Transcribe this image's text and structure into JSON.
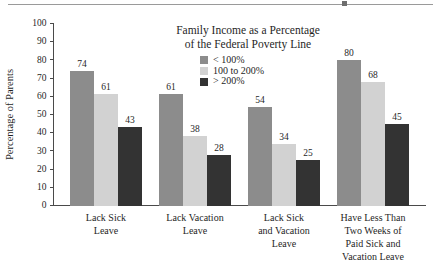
{
  "figure": {
    "separator_rule": true
  },
  "chart_data": {
    "type": "bar",
    "title": "",
    "xlabel": "",
    "ylabel": "Percentage of Parents",
    "ylim": [
      0,
      100
    ],
    "yticks": [
      0,
      10,
      20,
      30,
      40,
      50,
      60,
      70,
      80,
      90,
      100
    ],
    "grid": false,
    "legend_position": "inside-top-center",
    "legend_title": [
      "Family Income as a Percentage",
      "of the Federal Poverty Line"
    ],
    "categories": [
      "Lack Sick Leave",
      "Lack Vacation Leave",
      "Lack Sick and Vacation Leave",
      "Have Less Than Two Weeks of Paid Sick and Vacation Leave"
    ],
    "category_lines": [
      [
        "Lack Sick",
        "Leave"
      ],
      [
        "Lack Vacation",
        "Leave"
      ],
      [
        "Lack Sick",
        "and Vacation",
        "Leave"
      ],
      [
        "Have Less Than",
        "Two Weeks of",
        "Paid Sick and",
        "Vacation Leave"
      ]
    ],
    "series": [
      {
        "name": "< 100%",
        "color": "#8c8c8c",
        "values": [
          74,
          61,
          54,
          80
        ]
      },
      {
        "name": "100 to 200%",
        "color": "#d2d2d2",
        "values": [
          61,
          38,
          34,
          68
        ]
      },
      {
        "name": "> 200%",
        "color": "#333333",
        "values": [
          43,
          28,
          25,
          45
        ]
      }
    ],
    "series_values_display": {
      "group_1": [
        "74",
        "61",
        "43"
      ],
      "group_2": [
        "57",
        "38",
        "28"
      ],
      "group_3": [
        "54",
        "34",
        "25"
      ],
      "group_4": [
        "80",
        "68",
        "45"
      ]
    },
    "bars": [
      {
        "group": "Lack Sick Leave",
        "series": "< 100%",
        "value": 74,
        "label": "74"
      },
      {
        "group": "Lack Sick Leave",
        "series": "100 to 200%",
        "value": 61,
        "label": "61"
      },
      {
        "group": "Lack Sick Leave",
        "series": "> 200%",
        "value": 43,
        "label": "43"
      },
      {
        "group": "Lack Vacation Leave",
        "series": "< 100%",
        "value": 57,
        "label": "57"
      },
      {
        "group": "Lack Vacation Leave",
        "series": "100 to 200%",
        "value": 38,
        "label": "38"
      },
      {
        "group": "Lack Vacation Leave",
        "series": "> 200%",
        "value": 28,
        "label": "28"
      },
      {
        "group": "Lack Sick and Vacation Leave",
        "series": "< 100%",
        "value": 54,
        "label": "54"
      },
      {
        "group": "Lack Sick and Vacation Leave",
        "series": "100 to 200%",
        "value": 34,
        "label": "34"
      },
      {
        "group": "Lack Sick and Vacation Leave",
        "series": "> 200%",
        "value": 25,
        "label": "25"
      },
      {
        "group": "Have Less Than Two Weeks of Paid Sick and Vacation Leave",
        "series": "< 100%",
        "value": 80,
        "label": "80"
      },
      {
        "group": "Have Less Than Two Weeks of Paid Sick and Vacation Leave",
        "series": "100 to 200%",
        "value": 68,
        "label": "68"
      },
      {
        "group": "Have Less Than Two Weeks of Paid Sick and Vacation Leave",
        "series": "> 200%",
        "value": 45,
        "label": "45"
      }
    ]
  },
  "colors": {
    "axis": "#4a4a4a",
    "text": "#1f1f1f",
    "rule": "#9a9a9a",
    "background": "#ffffff"
  }
}
